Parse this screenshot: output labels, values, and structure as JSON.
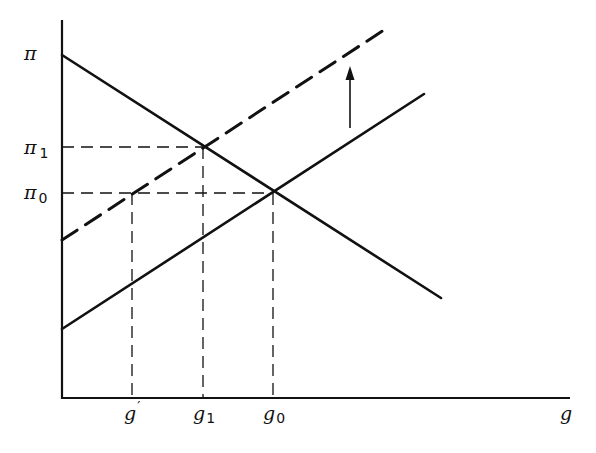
{
  "diagram": {
    "type": "economics-line-diagram",
    "axes": {
      "x_label": "g",
      "y_label": "π"
    },
    "y_ticks": [
      {
        "id": "pi",
        "base": "π",
        "sub": ""
      },
      {
        "id": "pi1",
        "base": "π",
        "sub": "1"
      },
      {
        "id": "pi0",
        "base": "π",
        "sub": "0"
      }
    ],
    "x_ticks": [
      {
        "id": "g_prime",
        "base": "g",
        "sub": "′"
      },
      {
        "id": "g1",
        "base": "g",
        "sub": "1"
      },
      {
        "id": "g0",
        "base": "g",
        "sub": "0"
      }
    ],
    "lines": [
      {
        "name": "downward-sloping-line",
        "style": "solid",
        "from": [
          62,
          55
        ],
        "to": [
          441,
          298
        ]
      },
      {
        "name": "upward-sloping-line-initial",
        "style": "solid",
        "from": [
          62,
          329
        ],
        "to": [
          424,
          94
        ]
      },
      {
        "name": "upward-sloping-line-shifted",
        "style": "dashed",
        "from": [
          62,
          240
        ],
        "to": [
          384,
          30
        ]
      }
    ],
    "shift_arrow": {
      "direction": "up",
      "x": 350,
      "from_y": 128,
      "to_y": 66
    },
    "intersections": [
      {
        "label": "π1 / g1",
        "point": [
          203,
          147
        ]
      },
      {
        "label": "π0 / g0",
        "point": [
          273,
          193
        ]
      },
      {
        "label": "π0 / g'",
        "point": [
          132,
          193
        ]
      }
    ],
    "colors": {
      "ink": "#111111",
      "background": "#ffffff"
    }
  }
}
